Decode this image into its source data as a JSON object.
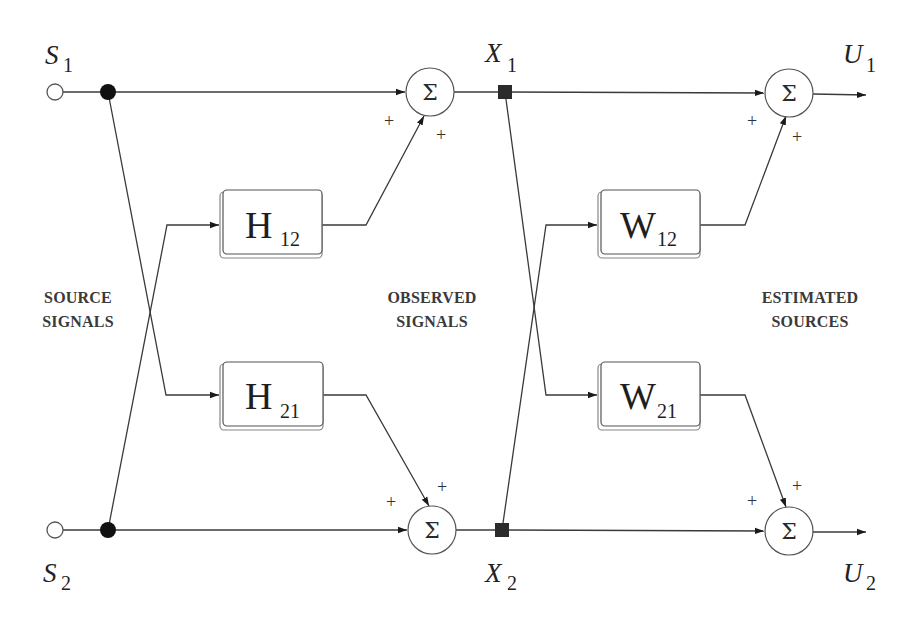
{
  "diagram": {
    "sources": [
      {
        "symbol": "S",
        "sub": "1"
      },
      {
        "symbol": "S",
        "sub": "2"
      }
    ],
    "observed": [
      {
        "symbol": "X",
        "sub": "1"
      },
      {
        "symbol": "X",
        "sub": "2"
      }
    ],
    "outputs": [
      {
        "symbol": "U",
        "sub": "1"
      },
      {
        "symbol": "U",
        "sub": "2"
      }
    ],
    "mixing_blocks": [
      {
        "symbol": "H",
        "sub": "12"
      },
      {
        "symbol": "H",
        "sub": "21"
      }
    ],
    "demixing_blocks": [
      {
        "symbol": "W",
        "sub": "12"
      },
      {
        "symbol": "W",
        "sub": "21"
      }
    ],
    "summer_symbol": "Σ",
    "sign": "+",
    "captions": {
      "source": [
        "SOURCE",
        "SIGNALS"
      ],
      "observed": [
        "OBSERVED",
        "SIGNALS"
      ],
      "estimated": [
        "ESTIMATED",
        "SOURCES"
      ]
    },
    "colors": {
      "line": "#3a3a3a",
      "node_fill": "#111111",
      "caption": "#3a3a3a",
      "background": "#ffffff"
    }
  }
}
